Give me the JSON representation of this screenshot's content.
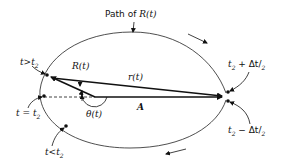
{
  "title": "Path of R(t)",
  "labels": {
    "path_prefix": "Path of",
    "path_symbol": "R(t)",
    "t_greater": "t>t",
    "t_greater_sub": "2",
    "t_equal": "t = t",
    "t_equal_sub": "2",
    "t_less": "t<t",
    "t_less_sub": "2",
    "R_vector": "R(t)",
    "r_vector": "r(t)",
    "A_point": "A",
    "theta": "θ(t)",
    "t_plus": "t",
    "t_plus_sub": "2",
    "t_plus_rest": " + Δt/",
    "t_plus_den": "2",
    "t_minus": "t",
    "t_minus_sub": "2",
    "t_minus_rest": " − Δt/",
    "t_minus_den": "2"
  },
  "colors": {
    "ink": "#111111",
    "background": "#ffffff"
  }
}
